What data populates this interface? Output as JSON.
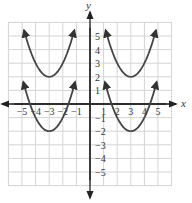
{
  "chart_data": {
    "type": "line",
    "title": "",
    "xlabel": "x",
    "ylabel": "y",
    "xlim": [
      -6,
      6
    ],
    "ylim": [
      -6,
      6
    ],
    "grid": true,
    "x_ticks": [
      "-5",
      "-4",
      "-3",
      "-2",
      "-1",
      "1",
      "2",
      "3",
      "4",
      "5"
    ],
    "y_ticks": [
      "5",
      "4",
      "3",
      "2",
      "1",
      "-1",
      "-2",
      "-3",
      "-4",
      "-5"
    ],
    "series": [
      {
        "name": "y = (x+3)^2 + 2",
        "vertex": [
          -3,
          2
        ],
        "x_range": [
          -4.85,
          -1.15
        ],
        "color": "#444444"
      },
      {
        "name": "y = (x+3)^2 - 2",
        "vertex": [
          -3,
          -2
        ],
        "x_range": [
          -4.9,
          -1.1
        ],
        "color": "#444444"
      },
      {
        "name": "y = (x-3)^2 + 2",
        "vertex": [
          3,
          2
        ],
        "x_range": [
          1.15,
          4.85
        ],
        "color": "#444444"
      },
      {
        "name": "y = (x-3)^2 - 2",
        "vertex": [
          3,
          -2
        ],
        "x_range": [
          1.1,
          4.9
        ],
        "color": "#444444"
      }
    ]
  },
  "labels": {
    "x_axis": "x",
    "y_axis": "y"
  }
}
